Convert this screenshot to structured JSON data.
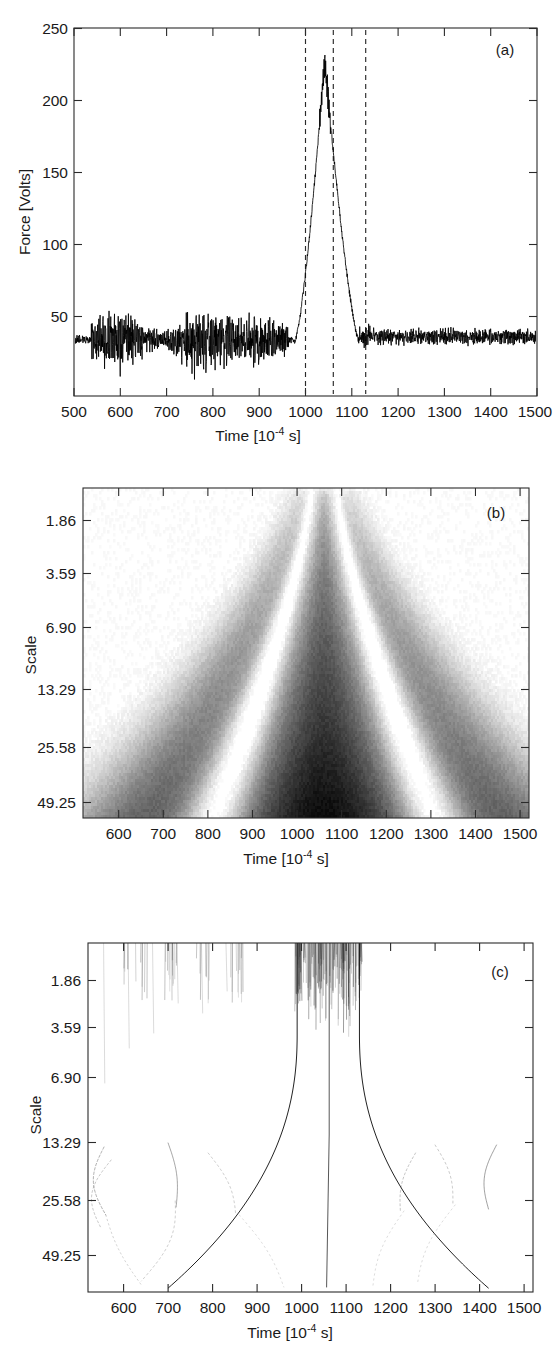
{
  "figure": {
    "background": "#ffffff",
    "ink": "#1a1a1a",
    "panels": [
      "a",
      "b",
      "c"
    ]
  },
  "panel_a": {
    "label": "(a)",
    "ylabel": "Force [Volts]",
    "xlabel_main": "Time [10",
    "xlabel_sup": "-4",
    "xlabel_tail": " s]",
    "yticks": [
      "250",
      "200",
      "150",
      "100",
      "50"
    ],
    "xticks": [
      "500",
      "600",
      "700",
      "800",
      "900",
      "1000",
      "1100",
      "1200",
      "1300",
      "1400",
      "1500"
    ]
  },
  "panel_b": {
    "label": "(b)",
    "ylabel": "Scale",
    "xlabel_main": "Time [10",
    "xlabel_sup": "-4",
    "xlabel_tail": " s]",
    "yticks": [
      "1.86",
      "3.59",
      "6.90",
      "13.29",
      "25.58",
      "49.25"
    ],
    "xticks": [
      "600",
      "700",
      "800",
      "900",
      "1000",
      "1100",
      "1200",
      "1300",
      "1400",
      "1500"
    ]
  },
  "panel_c": {
    "label": "(c)",
    "ylabel": "Scale",
    "xlabel_main": "Time [10",
    "xlabel_sup": "-4",
    "xlabel_tail": " s]",
    "yticks": [
      "1.86",
      "3.59",
      "6.90",
      "13.29",
      "25.58",
      "49.25"
    ],
    "xticks": [
      "600",
      "700",
      "800",
      "900",
      "1000",
      "1100",
      "1200",
      "1300",
      "1400",
      "1500"
    ]
  },
  "chart_data": [
    {
      "type": "line",
      "panel": "a",
      "title": "",
      "xlabel": "Time [10^-4 s]",
      "ylabel": "Force [Volts]",
      "xlim": [
        500,
        1525
      ],
      "ylim": [
        20,
        250
      ],
      "xticks": [
        500,
        600,
        700,
        800,
        900,
        1000,
        1100,
        1200,
        1300,
        1400,
        1500
      ],
      "yticks": [
        50,
        100,
        150,
        200,
        250
      ],
      "grid": false,
      "legend": null,
      "series": [
        {
          "name": "Force signal",
          "description": "Noisy baseline around 55 V with high-frequency oscillation; sharp impact burst rising from ~990 to a peak of ~230 V near t=1055, then falling back to baseline by ~1130.",
          "baseline_volts": 55,
          "noise_amplitude_volts": 18,
          "burst_start": 990,
          "burst_peak_time": 1055,
          "burst_peak_volts": 230,
          "burst_end": 1130,
          "points": [
            [
              500,
              53
            ],
            [
              540,
              55
            ],
            [
              600,
              55
            ],
            [
              650,
              56
            ],
            [
              700,
              55
            ],
            [
              760,
              55
            ],
            [
              800,
              56
            ],
            [
              860,
              56
            ],
            [
              920,
              55
            ],
            [
              975,
              56
            ],
            [
              990,
              58
            ],
            [
              1000,
              95
            ],
            [
              1010,
              130
            ],
            [
              1020,
              160
            ],
            [
              1030,
              190
            ],
            [
              1040,
              212
            ],
            [
              1050,
              226
            ],
            [
              1055,
              230
            ],
            [
              1060,
              228
            ],
            [
              1070,
              218
            ],
            [
              1080,
              196
            ],
            [
              1090,
              168
            ],
            [
              1100,
              135
            ],
            [
              1110,
              100
            ],
            [
              1120,
              72
            ],
            [
              1128,
              58
            ],
            [
              1140,
              57
            ],
            [
              1200,
              57
            ],
            [
              1300,
              57
            ],
            [
              1400,
              57
            ],
            [
              1500,
              57
            ]
          ]
        }
      ],
      "annotations": {
        "vertical_dashed_lines": [
          1000,
          1060,
          1130
        ],
        "panel_label": "(a)"
      }
    },
    {
      "type": "heatmap",
      "panel": "b",
      "title": "",
      "xlabel": "Time [10^-4 s]",
      "ylabel": "Scale",
      "xlim": [
        520,
        1520
      ],
      "ylim_scale_ticks": [
        1.86,
        3.59,
        6.9,
        13.29,
        25.58,
        49.25
      ],
      "colormap": "grayscale (white = low, black = high modulus)",
      "description": "Continuous wavelet transform modulus scalogram. A dark cone opens downward with increasing scale, centered at t~1060. A dark narrow central ridge is flanked by two white interference valleys, outside which broad gray lobes fan out to t~800 and t~1320 at the largest scale.",
      "cone_center_time": 1060,
      "cone_half_width_at_small_scale": 30,
      "cone_half_width_at_large_scale": 260,
      "xticks": [
        600,
        700,
        800,
        900,
        1000,
        1100,
        1200,
        1300,
        1400,
        1500
      ],
      "grid": false,
      "annotations": {
        "panel_label": "(b)"
      }
    },
    {
      "type": "line",
      "panel": "c",
      "title": "",
      "xlabel": "Time [10^-4 s]",
      "ylabel": "Scale",
      "xlim": [
        520,
        1520
      ],
      "ylim_scale_ticks": [
        1.86,
        3.59,
        6.9,
        13.29,
        25.58,
        49.25
      ],
      "description": "Wavelet transform modulus maxima (WTMM) skeleton. Dense short near-vertical maxima lines at the smallest scales in the impact burst (t~990-1130) and sparse short lines over the noisy baseline. Three strong maxima lines persist to large scale, bending outward: the left edge line from t~990, the central line at t~1060, and the right edge line from t~1130. Faint arc-shaped maxima lines appear at scales 13-49 around t~550-860 and t~1230-1450.",
      "xticks": [
        600,
        700,
        800,
        900,
        1000,
        1100,
        1200,
        1300,
        1400,
        1500
      ],
      "grid": false,
      "persistent_maxima_lines_time": [
        990,
        1060,
        1130
      ],
      "annotations": {
        "panel_label": "(c)"
      }
    }
  ]
}
